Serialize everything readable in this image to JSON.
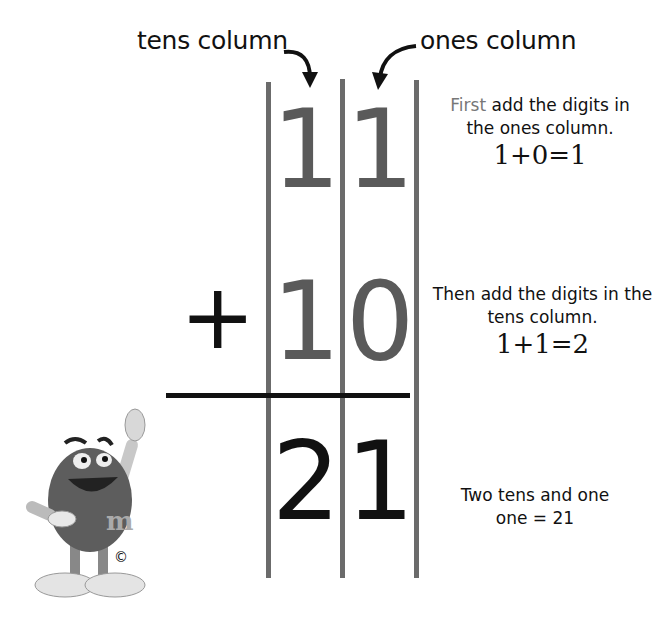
{
  "labels": {
    "tens_column": "tens column",
    "ones_column": "ones column"
  },
  "problem": {
    "operator": "+",
    "top_row": {
      "tens": "1",
      "ones": "1"
    },
    "second_row": {
      "tens": "1",
      "ones": "0"
    },
    "result_row": {
      "tens": "2",
      "ones": "1"
    }
  },
  "steps": [
    {
      "highlight": "First",
      "text": " add the digits in the ones column.",
      "equation": "1+0=1"
    },
    {
      "highlight": "",
      "text": "Then add the digits in the tens column.",
      "equation": "1+1=2"
    },
    {
      "highlight": "",
      "text": "Two tens and one one = 21",
      "equation": ""
    }
  ],
  "mascot": {
    "letter": "m",
    "copyright": "©"
  },
  "colors": {
    "column_lines": "#6b6b6b",
    "addend_digits": "#5a5a5a",
    "sum_digits": "#111111"
  }
}
